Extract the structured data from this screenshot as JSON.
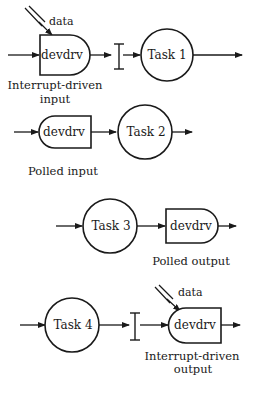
{
  "diagram": {
    "row1": {
      "data_label": "data",
      "device_label": "devdrv",
      "caption_line1": "Interrupt-driven",
      "caption_line2": "input",
      "task_label": "Task 1"
    },
    "row2": {
      "device_label": "devdrv",
      "caption": "Polled input",
      "task_label": "Task 2"
    },
    "row3": {
      "task_label": "Task 3",
      "device_label": "devdrv",
      "caption": "Polled output"
    },
    "row4": {
      "task_label": "Task 4",
      "data_label": "data",
      "device_label": "devdrv",
      "caption_line1": "Interrupt-driven",
      "caption_line2": "output"
    },
    "colors": {
      "stroke": "#1a1a1a",
      "background": "#ffffff"
    }
  }
}
